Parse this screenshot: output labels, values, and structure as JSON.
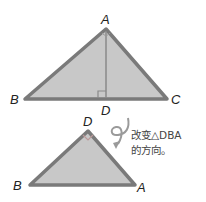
{
  "figure1": {
    "labels": {
      "A": "A",
      "B": "B",
      "C": "C",
      "D": "D"
    }
  },
  "figure2": {
    "labels": {
      "D": "D",
      "B": "B",
      "A": "A"
    }
  },
  "annotation": {
    "line1": "改变△DBA",
    "line2": "的方向。"
  },
  "colors": {
    "fill": "#c8c8c8",
    "stroke": "#7a7a7a",
    "text": "#222222"
  }
}
